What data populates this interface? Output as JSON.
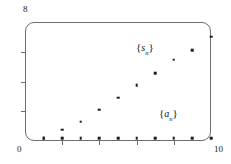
{
  "figure": {
    "kind": "scatter-plot",
    "background_color": "#ffffff",
    "frame_color": "#6e6e6e",
    "point_color": "#1c1c1c"
  },
  "axes": {
    "y_max_label": "8",
    "origin_label": "0",
    "x_max_label": "10",
    "x_range": [
      0,
      10
    ],
    "y_range": [
      0,
      8
    ],
    "x_ticks": [
      2,
      4,
      6,
      8
    ],
    "y_ticks": [
      2,
      4,
      6
    ]
  },
  "annotations": {
    "partial_sums": {
      "open_brace": "{",
      "symbol": "s",
      "subscript": "n",
      "close_brace": "}"
    },
    "terms": {
      "open_brace": "{",
      "symbol": "a",
      "subscript": "n",
      "close_brace": "}"
    }
  },
  "chart_data": {
    "type": "scatter",
    "title": "",
    "xlabel": "",
    "ylabel": "",
    "xlim": [
      0,
      10
    ],
    "ylim": [
      0,
      8
    ],
    "grid": false,
    "legend": "inline-annotations",
    "x": [
      1,
      2,
      3,
      4,
      5,
      6,
      7,
      8,
      9,
      10
    ],
    "series": [
      {
        "name": "{a_n}",
        "label": "{a_n}",
        "values": [
          0.2,
          0.2,
          0.2,
          0.2,
          0.2,
          0.2,
          0.2,
          0.2,
          0.2,
          0.2
        ]
      },
      {
        "name": "{s_n}",
        "label": "{s_n}",
        "values": [
          0.2,
          0.75,
          1.3,
          2.1,
          2.9,
          3.75,
          4.55,
          5.45,
          6.1,
          7.0
        ]
      }
    ]
  }
}
